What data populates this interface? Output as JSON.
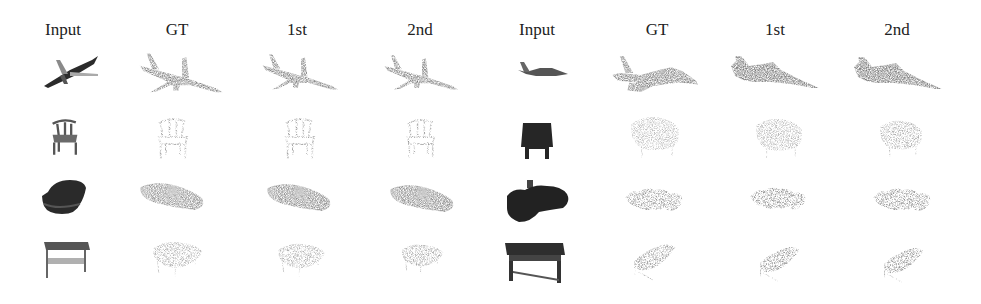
{
  "figure": {
    "type": "qualitative point cloud completion results",
    "groups": [
      {
        "columns": [
          {
            "label": "Input"
          },
          {
            "label": "GT"
          },
          {
            "label": "1st"
          },
          {
            "label": "2nd"
          }
        ]
      },
      {
        "columns": [
          {
            "label": "Input"
          },
          {
            "label": "GT"
          },
          {
            "label": "1st"
          },
          {
            "label": "2nd"
          }
        ]
      }
    ],
    "rows": [
      {
        "left_object": "airplane",
        "right_object": "fighter jet"
      },
      {
        "left_object": "chair",
        "right_object": "armchair"
      },
      {
        "left_object": "car",
        "right_object": "golf cart"
      },
      {
        "left_object": "table",
        "right_object": "bench table"
      }
    ],
    "colors": {
      "input_dark": "#2b2b2b",
      "point_cloud_gray": "#8a8a8a",
      "point_cloud_light": "#b5b5b5",
      "background": "#ffffff"
    }
  }
}
